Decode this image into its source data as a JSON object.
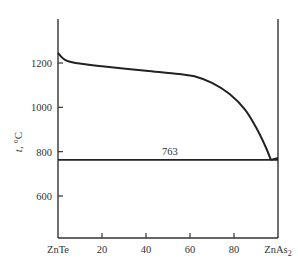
{
  "chart_data": {
    "type": "line",
    "title": "",
    "xlabel": "",
    "ylabel": "t, °C",
    "xlim": [
      0,
      100
    ],
    "ylim": [
      430,
      1420
    ],
    "grid": false,
    "x_ticks": [
      {
        "value": 0,
        "label": "ZnTe"
      },
      {
        "value": 20,
        "label": "20"
      },
      {
        "value": 40,
        "label": "40"
      },
      {
        "value": 60,
        "label": "60"
      },
      {
        "value": 80,
        "label": "80"
      },
      {
        "value": 100,
        "label": "ZnAs2"
      }
    ],
    "y_ticks": [
      600,
      800,
      1000,
      1200
    ],
    "series": [
      {
        "name": "liquidus",
        "x": [
          0,
          3,
          8,
          20,
          40,
          55,
          62,
          70,
          78,
          85,
          90,
          94,
          96.8
        ],
        "y": [
          1245,
          1215,
          1200,
          1185,
          1165,
          1150,
          1140,
          1110,
          1060,
          990,
          910,
          830,
          763
        ]
      },
      {
        "name": "liquidus-ZnAs2-side",
        "x": [
          96.8,
          100
        ],
        "y": [
          763,
          772
        ]
      },
      {
        "name": "eutectic-line",
        "x": [
          0,
          100
        ],
        "y": [
          763,
          763
        ]
      }
    ],
    "annotations": [
      {
        "text": "763",
        "x": 46,
        "y": 763
      }
    ]
  },
  "labels": {
    "ylabel_italic": "t",
    "ylabel_unit": ", °C",
    "eutectic": "763",
    "x_left": "ZnTe",
    "x_right_base": "ZnAs",
    "x_right_sub": "2"
  }
}
